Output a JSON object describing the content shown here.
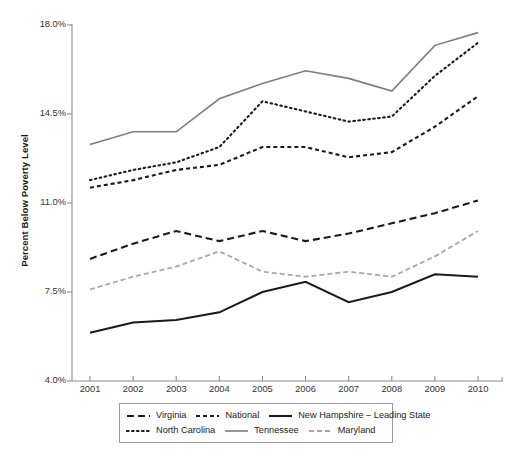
{
  "chart_data": {
    "type": "line",
    "title": "",
    "xlabel": "",
    "ylabel": "Percent Below Poverty Level",
    "x": [
      2001,
      2002,
      2003,
      2004,
      2005,
      2006,
      2007,
      2008,
      2009,
      2010
    ],
    "categories": [
      "2001",
      "2002",
      "2003",
      "2004",
      "2005",
      "2006",
      "2007",
      "2008",
      "2009",
      "2010"
    ],
    "xtick_labels": [
      "2001",
      "2002",
      "2003",
      "2004",
      "2005",
      "2006",
      "2007",
      "2008",
      "2009",
      "2010"
    ],
    "ytick_labels": [
      "18.0%",
      "14.5%",
      "11.0%",
      "7.5%",
      "4.0%"
    ],
    "ytick_values": [
      18.0,
      14.5,
      11.0,
      7.5,
      4.0
    ],
    "ylim": [
      4.0,
      18.0
    ],
    "xlim": [
      2001,
      2010
    ],
    "grid": false,
    "legend_position": "bottom",
    "series": [
      {
        "name": "Virginia",
        "style": "dashed",
        "color": "#1a1a1a",
        "width": 2.1,
        "dash": "7,4",
        "values": [
          8.8,
          9.4,
          9.9,
          9.5,
          9.9,
          9.5,
          9.8,
          10.2,
          10.6,
          11.1
        ]
      },
      {
        "name": "National",
        "style": "short-dashed",
        "color": "#1a1a1a",
        "width": 2.1,
        "dash": "4,3",
        "values": [
          11.6,
          11.9,
          12.3,
          12.5,
          13.2,
          13.2,
          12.8,
          13.0,
          14.0,
          15.2
        ]
      },
      {
        "name": "New Hampshire – Leading State",
        "style": "solid",
        "color": "#1a1a1a",
        "width": 2.1,
        "dash": "",
        "values": [
          5.9,
          6.3,
          6.4,
          6.7,
          7.5,
          7.9,
          7.1,
          7.5,
          8.2,
          8.1
        ]
      },
      {
        "name": "North Carolina",
        "style": "dotted",
        "color": "#1a1a1a",
        "width": 2.1,
        "dash": "1.6,3.4",
        "values": [
          11.9,
          12.3,
          12.6,
          13.2,
          15.0,
          14.6,
          14.2,
          14.4,
          16.0,
          17.3
        ]
      },
      {
        "name": "Tennessee",
        "style": "solid",
        "color": "#7d7d7d",
        "width": 1.6,
        "dash": "",
        "values": [
          13.3,
          13.8,
          13.8,
          15.1,
          15.7,
          16.2,
          15.9,
          15.4,
          17.2,
          17.7
        ]
      },
      {
        "name": "Maryland",
        "style": "dashed-gray",
        "color": "#a8a8a8",
        "width": 1.8,
        "dash": "5,3",
        "values": [
          7.6,
          8.1,
          8.5,
          9.1,
          8.3,
          8.1,
          8.3,
          8.1,
          8.9,
          9.9
        ]
      }
    ]
  },
  "legend": {
    "row1": [
      {
        "label": "Virginia",
        "series": 0
      },
      {
        "label": "National",
        "series": 1
      },
      {
        "label": "New Hampshire – Leading State",
        "series": 2
      }
    ],
    "row2": [
      {
        "label": "North Carolina",
        "series": 3
      },
      {
        "label": "Tennessee",
        "series": 4
      },
      {
        "label": "Maryland",
        "series": 5
      }
    ]
  },
  "axes": {
    "axis_color": "#8c8c8c",
    "tick_color": "#8c8c8c"
  }
}
